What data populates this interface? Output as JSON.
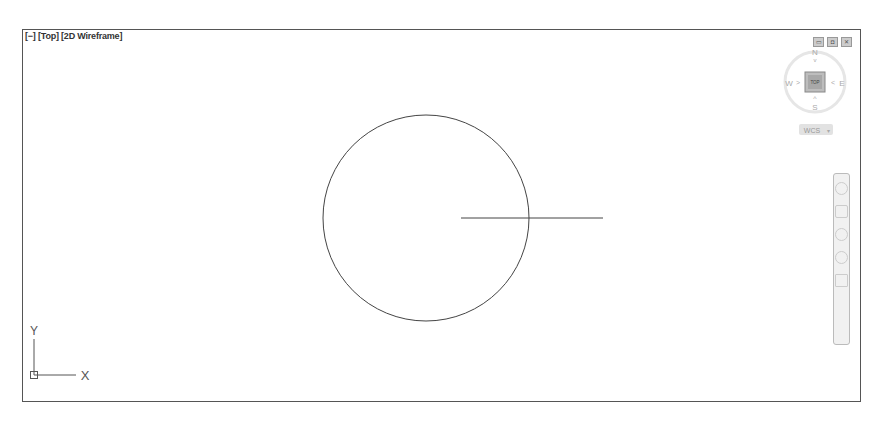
{
  "viewport": {
    "label": "[−] [Top] [2D Wireframe]",
    "window_controls": [
      "restore",
      "maximize",
      "close"
    ]
  },
  "viewcube": {
    "face": "TOP",
    "north": "N",
    "south": "S",
    "east": "E",
    "west": "W",
    "ucs_menu": "WCS"
  },
  "ucs_icon": {
    "x_label": "X",
    "y_label": "Y"
  },
  "drawing": {
    "circle": {
      "cx": 403,
      "cy": 188,
      "r": 103
    },
    "line": {
      "x1": 438,
      "y1": 188,
      "x2": 580,
      "y2": 188
    },
    "stroke_color": "#444444"
  },
  "navigation_bar": {
    "tools": [
      "steering-wheel",
      "pan",
      "zoom",
      "orbit",
      "showmotion"
    ]
  }
}
